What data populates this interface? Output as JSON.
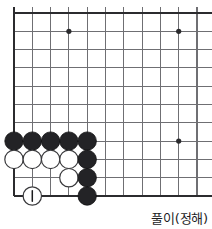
{
  "diagram": {
    "kind": "go-board-diagram",
    "caption": "풀이(정해)",
    "board": {
      "origin_x": 14,
      "origin_y": 13,
      "spacing": 18.3,
      "cols": 11,
      "rows": 11,
      "edges": [
        "left",
        "top",
        "bottom"
      ],
      "star_points": [
        {
          "col": 3,
          "row": 1
        },
        {
          "col": 9,
          "row": 1
        },
        {
          "col": 9,
          "row": 7
        }
      ],
      "stone_radius": 9.2
    },
    "stones": [
      {
        "color": "black",
        "col": 0,
        "row": 7
      },
      {
        "color": "black",
        "col": 1,
        "row": 7
      },
      {
        "color": "black",
        "col": 2,
        "row": 7
      },
      {
        "color": "black",
        "col": 3,
        "row": 7
      },
      {
        "color": "black",
        "col": 4,
        "row": 7
      },
      {
        "color": "white",
        "col": 0,
        "row": 8
      },
      {
        "color": "white",
        "col": 1,
        "row": 8
      },
      {
        "color": "white",
        "col": 2,
        "row": 8
      },
      {
        "color": "white",
        "col": 3,
        "row": 8
      },
      {
        "color": "black",
        "col": 4,
        "row": 8
      },
      {
        "color": "white",
        "col": 3,
        "row": 9
      },
      {
        "color": "black",
        "col": 4,
        "row": 9
      },
      {
        "color": "white",
        "col": 1,
        "row": 10,
        "label": "1"
      },
      {
        "color": "black",
        "col": 4,
        "row": 10
      }
    ],
    "move_labels": [
      {
        "number": "1",
        "color": "white",
        "col": 1,
        "row": 10
      }
    ]
  }
}
